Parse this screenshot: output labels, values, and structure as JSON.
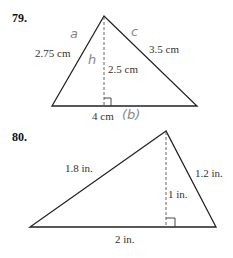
{
  "problems": [
    {
      "number": "79.",
      "sides": {
        "left": "2.75 cm",
        "right": "3.5 cm",
        "base": "4 cm"
      },
      "height": "2.5 cm",
      "annotations": {
        "left": "a",
        "right": "c",
        "height": "h",
        "base": "(b)"
      }
    },
    {
      "number": "80.",
      "sides": {
        "left": "1.8 in.",
        "right": "1.2 in.",
        "base": "2 in."
      },
      "height": "1 in."
    }
  ]
}
